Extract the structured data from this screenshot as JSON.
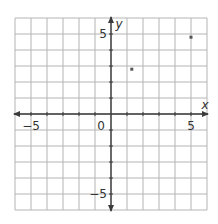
{
  "chart_data": {
    "type": "scatter",
    "title": "",
    "xlabel": "x",
    "ylabel": "y",
    "xlim": [
      -6,
      6
    ],
    "ylim": [
      -6,
      6
    ],
    "grid": true,
    "grid_step": 1,
    "x_tick_labels": [
      {
        "value": -5,
        "label": "−5"
      },
      {
        "value": 5,
        "label": "5"
      }
    ],
    "y_tick_labels": [
      {
        "value": 5,
        "label": "5"
      },
      {
        "value": -5,
        "label": "−5"
      }
    ],
    "origin_label": "0",
    "series": [
      {
        "name": "points",
        "x": [
          1.3,
          5
        ],
        "y": [
          2.8,
          4.8
        ]
      }
    ]
  },
  "style": {
    "grid_color": "#b5b5b5",
    "axis_color": "#3a3a3a",
    "point_color": "#555555",
    "background": "#ffffff"
  },
  "layout": {
    "left": 15,
    "top": 18,
    "cell": 16,
    "cells": 12
  }
}
